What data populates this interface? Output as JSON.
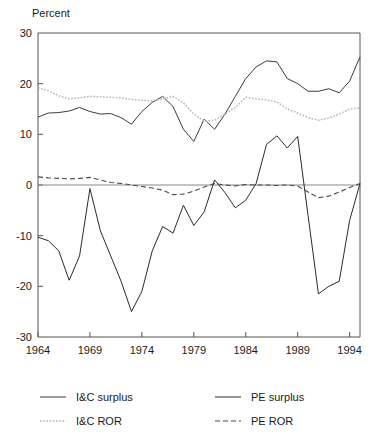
{
  "chart_data": {
    "type": "line",
    "title": "",
    "ylabel": "Percent",
    "xlabel": "",
    "ylim": [
      -30,
      30
    ],
    "xlim": [
      1964,
      1995
    ],
    "grid": false,
    "legend_position": "bottom",
    "yticks": [
      "30",
      "20",
      "10",
      "0",
      "-10",
      "-20",
      "-30"
    ],
    "ytick_values": [
      30,
      20,
      10,
      0,
      -10,
      -20,
      -30
    ],
    "xticks": [
      "1964",
      "1969",
      "1974",
      "1979",
      "1984",
      "1989",
      "1994"
    ],
    "xtick_values": [
      1964,
      1969,
      1974,
      1979,
      1984,
      1989,
      1994
    ],
    "x": [
      1964,
      1965,
      1966,
      1967,
      1968,
      1969,
      1970,
      1971,
      1972,
      1973,
      1974,
      1975,
      1976,
      1977,
      1978,
      1979,
      1980,
      1981,
      1982,
      1983,
      1984,
      1985,
      1986,
      1987,
      1988,
      1989,
      1990,
      1991,
      1992,
      1993,
      1994,
      1995
    ],
    "series": [
      {
        "name": "I&C surplus",
        "style": "solid",
        "color": "#3a3a3a",
        "values": [
          13.4,
          14.2,
          14.3,
          14.6,
          15.3,
          14.5,
          14.0,
          14.1,
          13.3,
          12.0,
          14.5,
          16.3,
          17.5,
          15.5,
          11.0,
          8.6,
          13.0,
          11.0,
          14.0,
          17.5,
          21.0,
          23.3,
          24.5,
          24.3,
          21.0,
          20.0,
          18.5,
          18.5,
          19.0,
          18.2,
          20.5,
          25.3
        ]
      },
      {
        "name": "I&C ROR",
        "style": "dotted",
        "color": "#b4b4b4",
        "values": [
          19.2,
          18.6,
          17.6,
          17.0,
          17.2,
          17.5,
          17.4,
          17.3,
          17.2,
          16.9,
          16.7,
          16.6,
          17.0,
          17.5,
          16.2,
          14.0,
          12.6,
          12.8,
          14.0,
          15.3,
          17.3,
          17.0,
          16.8,
          16.4,
          15.0,
          14.2,
          13.3,
          12.8,
          13.2,
          14.0,
          15.0,
          15.2
        ]
      },
      {
        "name": "PE surplus",
        "style": "solid",
        "color": "#2a2a2a",
        "values": [
          -10.3,
          -11.0,
          -13.0,
          -18.8,
          -14.0,
          -0.7,
          -9.0,
          -14.0,
          -19.0,
          -25.0,
          -21.0,
          -13.0,
          -8.2,
          -9.5,
          -4.0,
          -8.0,
          -5.3,
          1.0,
          -1.5,
          -4.5,
          -3.0,
          0.3,
          8.0,
          9.7,
          7.3,
          9.6,
          -6.0,
          -21.5,
          -20.0,
          -19.0,
          -7.0,
          0.3
        ]
      },
      {
        "name": "PE ROR",
        "style": "dashed",
        "color": "#4a4a4a",
        "values": [
          1.6,
          1.4,
          1.3,
          1.2,
          1.3,
          1.5,
          1.0,
          0.5,
          0.3,
          0.0,
          -0.3,
          -0.6,
          -1.0,
          -1.9,
          -1.8,
          -1.2,
          -0.4,
          0.3,
          0.0,
          -0.2,
          0.1,
          0.0,
          0.0,
          -0.1,
          0.0,
          -0.2,
          -1.4,
          -2.5,
          -2.2,
          -1.4,
          -0.5,
          0.3
        ]
      }
    ]
  },
  "legend": {
    "entries": [
      {
        "label": "I&C surplus",
        "style": "solid",
        "color": "#3a3a3a"
      },
      {
        "label": "PE surplus",
        "style": "solid",
        "color": "#2a2a2a"
      },
      {
        "label": "I&C ROR",
        "style": "dotted",
        "color": "#b4b4b4"
      },
      {
        "label": "PE ROR",
        "style": "dashed",
        "color": "#4a4a4a"
      }
    ]
  }
}
